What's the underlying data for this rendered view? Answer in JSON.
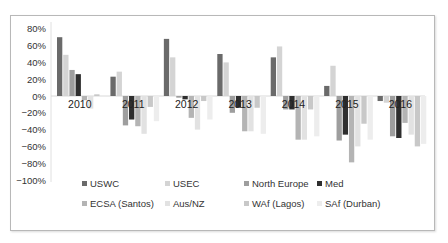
{
  "chart_data": {
    "type": "bar",
    "title": "",
    "xlabel": "",
    "ylabel": "",
    "ylim": [
      -100,
      80
    ],
    "y_ticks": [
      "80%",
      "60%",
      "40%",
      "20%",
      "0%",
      "−20%",
      "−40%",
      "−60%",
      "−80%",
      "−100%"
    ],
    "y_tick_values": [
      80,
      60,
      40,
      20,
      0,
      -20,
      -40,
      -60,
      -80,
      -100
    ],
    "grid": false,
    "legend_position": "bottom",
    "categories": [
      "2010",
      "2011",
      "2012",
      "2013",
      "2014",
      "2015",
      "2016"
    ],
    "series": [
      {
        "name": "USWC",
        "color": "#6a6a6a",
        "values": [
          70,
          23,
          68,
          50,
          46,
          12,
          -6
        ]
      },
      {
        "name": "USEC",
        "color": "#d4d4d4",
        "values": [
          49,
          29,
          46,
          40,
          59,
          36,
          -8
        ]
      },
      {
        "name": "North Europe",
        "color": "#9e9e9e",
        "values": [
          31,
          -35,
          -2,
          -20,
          -16,
          -53,
          -48
        ]
      },
      {
        "name": "Med",
        "color": "#2e2e2e",
        "values": [
          26,
          -28,
          -4,
          -14,
          -16,
          -46,
          -50
        ]
      },
      {
        "name": "ECSA (Santos)",
        "color": "#b4b4b4",
        "values": [
          -5,
          -36,
          -26,
          -42,
          -52,
          -79,
          -32
        ]
      },
      {
        "name": "Aus/NZ",
        "color": "#e2e2e2",
        "values": [
          -15,
          -45,
          -40,
          -42,
          -52,
          -60,
          -46
        ]
      },
      {
        "name": "WAf (Lagos)",
        "color": "#c8c8c8",
        "values": [
          2,
          -13,
          -6,
          -14,
          -16,
          -33,
          -60
        ]
      },
      {
        "name": "SAf (Durban)",
        "color": "#ededed",
        "values": [
          0,
          -30,
          -28,
          -45,
          -48,
          -52,
          -57
        ]
      }
    ]
  }
}
